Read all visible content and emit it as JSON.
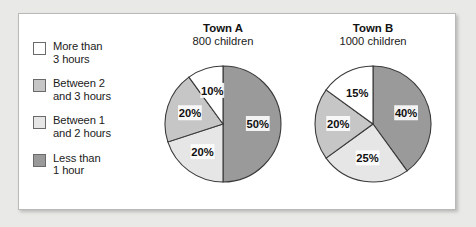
{
  "legend": {
    "items": [
      {
        "label": "More than\n3 hours",
        "color": "#ffffff",
        "swatch_name": "legend-swatch-more-than-3-hours"
      },
      {
        "label": "Between 2\nand 3 hours",
        "color": "#c6c6c6",
        "swatch_name": "legend-swatch-between-2-and-3-hours"
      },
      {
        "label": "Between 1\nand 2 hours",
        "color": "#e6e6e6",
        "swatch_name": "legend-swatch-between-1-and-2-hours"
      },
      {
        "label": "Less than\n1 hour",
        "color": "#9a9a9a",
        "swatch_name": "legend-swatch-less-than-1-hour"
      }
    ]
  },
  "colors": {
    "more_than_3_hours": "#ffffff",
    "between_2_and_3_hours": "#c6c6c6",
    "between_1_and_2_hours": "#e6e6e6",
    "less_than_1_hour": "#9a9a9a",
    "outline": "#3a3a3a",
    "panel_background": "#ffffff",
    "page_background": "#e9e9e7",
    "panel_border": "#b9b9b7"
  },
  "chart_data": [
    {
      "type": "pie",
      "title": "Town A",
      "subtitle": "800 children",
      "categories": [
        "Less than 1 hour",
        "Between 1 and 2 hours",
        "Between 2 and 3 hours",
        "More than 3 hours"
      ],
      "values": [
        50,
        20,
        20,
        10
      ],
      "labels": [
        "50%",
        "20%",
        "20%",
        "10%"
      ],
      "unit": "%",
      "total_children": 800,
      "start_angle_deg": 0,
      "direction": "clockwise",
      "legend_position": "left"
    },
    {
      "type": "pie",
      "title": "Town B",
      "subtitle": "1000 children",
      "categories": [
        "Less than 1 hour",
        "Between 1 and 2 hours",
        "Between 2 and 3 hours",
        "More than 3 hours"
      ],
      "values": [
        40,
        25,
        20,
        15
      ],
      "labels": [
        "40%",
        "25%",
        "20%",
        "15%"
      ],
      "unit": "%",
      "total_children": 1000,
      "start_angle_deg": 0,
      "direction": "clockwise",
      "legend_position": "left"
    }
  ]
}
